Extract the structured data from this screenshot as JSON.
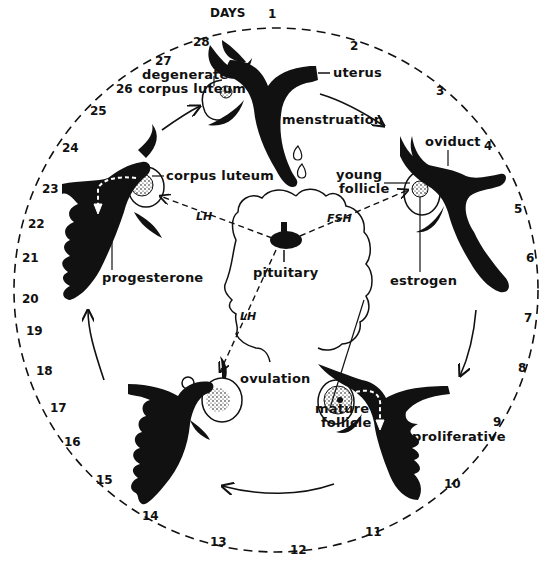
{
  "diagram": {
    "colors": {
      "ink": "#111111",
      "background": "#ffffff"
    },
    "days_label": "DAYS",
    "days": [
      "1",
      "2",
      "3",
      "4",
      "5",
      "6",
      "7",
      "8",
      "9",
      "10",
      "11",
      "12",
      "13",
      "14",
      "15",
      "16",
      "17",
      "18",
      "19",
      "20",
      "21",
      "22",
      "23",
      "24",
      "25",
      "26",
      "27",
      "28"
    ],
    "labels": {
      "uterus": "uterus",
      "menstruation": "menstruation",
      "degenerate_cl_1": "degenerate",
      "degenerate_cl_2": "corpus luteum",
      "oviduct": "oviduct",
      "young_follicle_1": "young",
      "young_follicle_2": "follicle",
      "corpus_luteum": "corpus luteum",
      "progesterone": "progesterone",
      "pituitary": "pituitary",
      "estrogen": "estrogen",
      "ovulation": "ovulation",
      "mature_follicle_1": "mature",
      "mature_follicle_2": "follicle",
      "proliferative": "proliferative"
    },
    "hormones": {
      "lh_top": "LH",
      "fsh": "FSH",
      "lh_bottom": "LH"
    }
  }
}
